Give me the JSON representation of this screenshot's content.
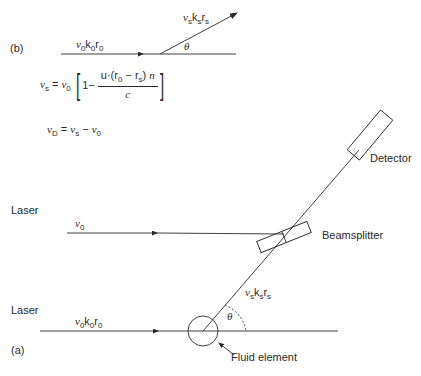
{
  "panel_b": {
    "label": "(b)",
    "incident": {
      "v": "ν",
      "v_sub": "0",
      "k": "k",
      "k_sub": "0",
      "r": "r",
      "r_sub": "0"
    },
    "scattered": {
      "v": "ν",
      "v_sub": "s",
      "k": "k",
      "k_sub": "s",
      "r": "r",
      "r_sub": "s"
    },
    "angle": "θ"
  },
  "equations": {
    "eq1": {
      "lhs": "ν",
      "lhs_sub": "s",
      "eq": "=",
      "rhs_v": "ν",
      "rhs_sub": "0",
      "one_minus": "1−",
      "numerator": "u·(r",
      "num_sub0": "0",
      "num_mid": " − r",
      "num_subs": "s",
      "num_end": ") ",
      "num_n": "n",
      "denominator": "c"
    },
    "eq2": {
      "lhs": "ν",
      "lhs_sub": "D",
      "eq": "=",
      "a": "ν",
      "a_sub": "s",
      "minus": "−",
      "b": "ν",
      "b_sub": "0"
    }
  },
  "panel_a": {
    "label": "(a)",
    "laser_top": "Laser",
    "laser_bottom": "Laser",
    "beam_top": {
      "v": "ν",
      "v_sub": "0"
    },
    "beam_bottom": {
      "v": "ν",
      "v_sub": "0",
      "k": "k",
      "k_sub": "0",
      "r": "r",
      "r_sub": "0"
    },
    "scattered": {
      "v": "ν",
      "v_sub": "s",
      "k": "k",
      "k_sub": "s",
      "r": "r",
      "r_sub": "s"
    },
    "angle": "θ",
    "detector": "Detector",
    "beamsplitter": "Beamsplitter",
    "fluid_element": "Fluid element"
  },
  "colors": {
    "line": "#2a2a2a",
    "background": "#ffffff"
  }
}
